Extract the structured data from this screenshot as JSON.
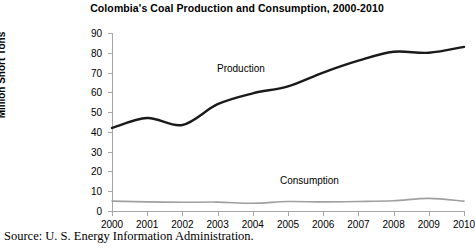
{
  "chart_data": {
    "type": "line",
    "title": "Colombia's Coal Production and Consumption, 2000-2010",
    "xlabel": "",
    "ylabel": "Million Short Tons",
    "categories": [
      "2000",
      "2001",
      "2002",
      "2003",
      "2004",
      "2005",
      "2006",
      "2007",
      "2008",
      "2009",
      "2010"
    ],
    "x": [
      2000,
      2001,
      2002,
      2003,
      2004,
      2005,
      2006,
      2007,
      2008,
      2009,
      2010
    ],
    "ylim": [
      0,
      90
    ],
    "yticks": [
      0,
      10,
      20,
      30,
      40,
      50,
      60,
      70,
      80,
      90
    ],
    "grid": false,
    "legend": "inline-annotations",
    "series": [
      {
        "name": "Production",
        "color": "#1a1a1a",
        "values": [
          42.0,
          47.0,
          43.5,
          54.0,
          59.5,
          63.0,
          70.0,
          76.0,
          80.5,
          80.0,
          83.0
        ]
      },
      {
        "name": "Consumption",
        "color": "#a0a0a0",
        "values": [
          5.0,
          4.6,
          4.4,
          4.5,
          3.9,
          4.8,
          4.6,
          4.8,
          5.2,
          6.4,
          5.0
        ]
      }
    ],
    "annotations": [
      {
        "text": "Production",
        "series": "Production"
      },
      {
        "text": "Consumption",
        "series": "Consumption"
      }
    ]
  },
  "caption": {
    "source": "Source: U. S. Energy Information Administration."
  }
}
